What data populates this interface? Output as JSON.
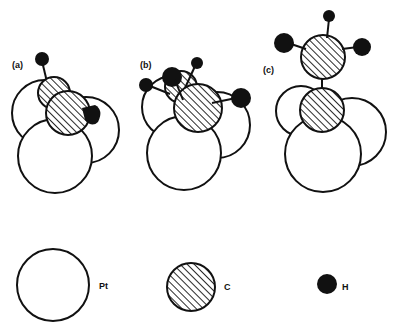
{
  "figure": {
    "panels": [
      {
        "label": "(a)",
        "description": "CH3 adsorbed in hollow site, tilted"
      },
      {
        "label": "(b)",
        "description": "CH3 adsorbed in hollow site, three H atoms"
      },
      {
        "label": "(c)",
        "description": "CCH3 (ethylidyne) on three-fold hollow site"
      }
    ],
    "legend": [
      {
        "symbol": "open-circle",
        "label": "Pt"
      },
      {
        "symbol": "hatched-circle",
        "label": "C"
      },
      {
        "symbol": "filled-circle",
        "label": "H"
      }
    ],
    "colors": {
      "stroke": "#111111",
      "fill_H": "#111111",
      "fill_Pt": "#ffffff"
    }
  }
}
